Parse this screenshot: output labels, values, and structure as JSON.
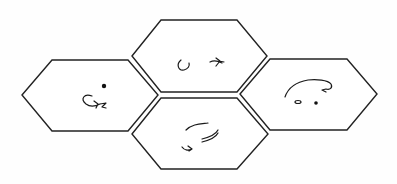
{
  "diagram": {
    "type": "hexagon-tiles",
    "tile_count": 4,
    "stroke_color": "#222222",
    "background": "#ffffff",
    "tiles": [
      {
        "id": "left",
        "position": "left",
        "content": "hand-drawn curl glyph with dot"
      },
      {
        "id": "top",
        "position": "top-center",
        "content": "hand-drawn loop and arrow glyphs"
      },
      {
        "id": "bottom",
        "position": "bottom-center",
        "content": "hand-drawn curved strokes and arrow glyph"
      },
      {
        "id": "right",
        "position": "right",
        "content": "hand-drawn arc with small circle and dot"
      }
    ]
  }
}
